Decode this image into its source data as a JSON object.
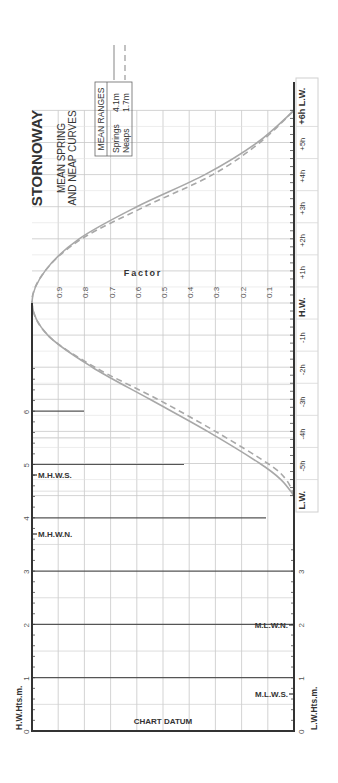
{
  "title": "STORNOWAY",
  "subtitle_line1": "MEAN SPRING",
  "subtitle_line2": "AND NEAP CURVES",
  "legend": {
    "header": "MEAN RANGES",
    "springs_label": "Springs",
    "springs_value": "4.1m",
    "neaps_label": "Neaps",
    "neaps_value": "1.7m"
  },
  "factor_label": "Factor",
  "hw_axis_label": "H.W.Hts.m.",
  "lw_axis_label": "L.W.Hts.m.",
  "chart_datum_label": "CHART DATUM",
  "level_labels": {
    "mhws": "M.H.W.S.",
    "mhwn": "M.H.W.N.",
    "mlwn": "M.L.W.N.",
    "mlws": "M.L.W.S."
  },
  "colors": {
    "axis": "#333333",
    "grid": "#c8c8c8",
    "curve": "#a8a8a8",
    "text": "#333333"
  },
  "chart_data": {
    "type": "line",
    "orientation": "rotated 90° counter-clockwise",
    "x_axis": {
      "label": "Time relative to High Water (hours)",
      "ticks": [
        "L.W.",
        "-5h",
        "-4h",
        "-3h",
        "-2h",
        "-1h",
        "H.W.",
        "+1h",
        "+2h",
        "+3h",
        "+4h",
        "+5h",
        "+6h L.W."
      ],
      "range": [
        -6,
        6
      ]
    },
    "y_axis": {
      "label": "Factor",
      "ticks": [
        "0.1",
        "0.2",
        "0.3",
        "0.4",
        "0.5",
        "0.6",
        "0.7",
        "0.8",
        "0.9"
      ],
      "range": [
        0,
        1
      ]
    },
    "series": [
      {
        "name": "Springs (4.1m)",
        "style": "solid",
        "x": [
          -6,
          -5.5,
          -5,
          -4,
          -3,
          -2,
          -1,
          0,
          1,
          2,
          3,
          4,
          5,
          6
        ],
        "values": [
          0.0,
          0.05,
          0.13,
          0.33,
          0.55,
          0.77,
          0.94,
          1.0,
          0.95,
          0.82,
          0.6,
          0.34,
          0.14,
          0.0
        ]
      },
      {
        "name": "Neaps (1.7m)",
        "style": "dashed",
        "x": [
          -6,
          -5.5,
          -5,
          -4,
          -3,
          -2,
          -1,
          0,
          1,
          2,
          3,
          4,
          5,
          6
        ],
        "values": [
          0.0,
          0.03,
          0.1,
          0.3,
          0.52,
          0.76,
          0.94,
          1.0,
          0.95,
          0.81,
          0.57,
          0.31,
          0.13,
          0.0
        ]
      }
    ],
    "height_scale": {
      "hw_label": "H.W.Hts.m.",
      "lw_label": "L.W.Hts.m.",
      "hw_ticks": [
        "0",
        "1",
        "2",
        "3",
        "4",
        "5",
        "6"
      ],
      "lw_ticks": [
        "0",
        "1",
        "2",
        "3"
      ],
      "levels": [
        {
          "name": "M.H.W.S.",
          "height": 4.8
        },
        {
          "name": "M.H.W.N.",
          "height": 3.6
        },
        {
          "name": "M.L.W.N.",
          "height": 1.9
        },
        {
          "name": "M.L.W.S.",
          "height": 0.7
        }
      ],
      "datum": "CHART DATUM"
    }
  }
}
